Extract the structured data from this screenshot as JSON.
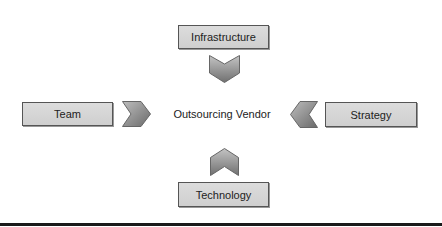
{
  "diagram": {
    "center": {
      "label": "Outsourcing Vendor"
    },
    "nodes": {
      "top": {
        "label": "Infrastructure"
      },
      "left": {
        "label": "Team"
      },
      "right": {
        "label": "Strategy"
      },
      "bottom": {
        "label": "Technology"
      }
    },
    "colors": {
      "box_fill": "#d6d6d6",
      "box_border": "#555555",
      "chevron_fill": "#8c8c8c",
      "baseline": "#1a1a1a"
    }
  }
}
